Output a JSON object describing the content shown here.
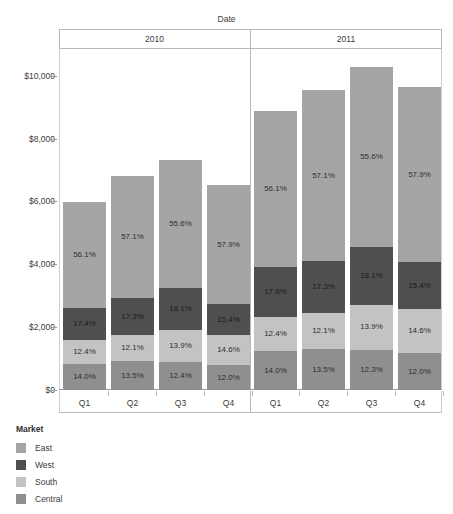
{
  "chart_data": {
    "type": "bar",
    "subtype": "stacked-percent-labeled",
    "title": "",
    "xlabel": "Date",
    "ylabel": "Profit",
    "ylim": [
      0,
      11000
    ],
    "grid": false,
    "legend_position": "bottom-left",
    "group_headers": [
      "2010",
      "2011"
    ],
    "categories": [
      "Q1",
      "Q2",
      "Q3",
      "Q4",
      "Q1",
      "Q2",
      "Q3",
      "Q4"
    ],
    "ytick_labels": [
      "$10,000",
      "$8,000",
      "$6,000",
      "$4,000",
      "$2,000",
      "$0"
    ],
    "ytick_values": [
      10000,
      8000,
      6000,
      4000,
      2000,
      0
    ],
    "series": [
      {
        "name": "East",
        "color": "#a5a5a5",
        "labels": [
          "56.1%",
          "57.1%",
          "55.6%",
          "57.9%",
          "56.1%",
          "57.1%",
          "55.6%",
          "57.9%"
        ],
        "values": [
          56.1,
          57.1,
          55.6,
          57.9,
          56.1,
          57.1,
          55.6,
          57.9
        ]
      },
      {
        "name": "West",
        "color": "#4f4f4f",
        "labels": [
          "17.4%",
          "17.3%",
          "18.1%",
          "15.4%",
          "17.6%",
          "17.3%",
          "18.1%",
          "15.4%"
        ],
        "values": [
          17.4,
          17.3,
          18.1,
          15.4,
          17.6,
          17.3,
          18.1,
          15.4
        ]
      },
      {
        "name": "South",
        "color": "#c3c3c3",
        "labels": [
          "12.4%",
          "12.1%",
          "13.9%",
          "14.6%",
          "12.4%",
          "12.1%",
          "13.9%",
          "14.6%"
        ],
        "values": [
          12.4,
          12.1,
          13.9,
          14.6,
          12.4,
          12.1,
          13.9,
          14.6
        ]
      },
      {
        "name": "Central",
        "color": "#8f8f8f",
        "labels": [
          "14.0%",
          "13.5%",
          "12.4%",
          "12.0%",
          "14.0%",
          "13.5%",
          "12.3%",
          "12.0%"
        ],
        "values": [
          14.0,
          13.5,
          12.4,
          12.0,
          14.0,
          13.5,
          12.3,
          12.0
        ]
      }
    ],
    "bar_totals": [
      6000,
      6830,
      7340,
      6540,
      8920,
      9590,
      10320,
      9680
    ]
  },
  "legend": {
    "title": "Market",
    "items": [
      {
        "label": "East",
        "color": "#a5a5a5"
      },
      {
        "label": "West",
        "color": "#4f4f4f"
      },
      {
        "label": "South",
        "color": "#c3c3c3"
      },
      {
        "label": "Central",
        "color": "#8f8f8f"
      }
    ]
  },
  "axis": {
    "x_title": "Date",
    "y_title": "Profit"
  }
}
